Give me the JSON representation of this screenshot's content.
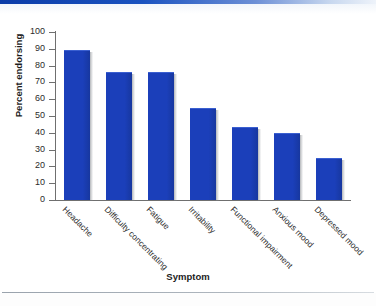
{
  "chart_data": {
    "type": "bar",
    "title": "",
    "xlabel": "Symptom",
    "ylabel": "Percent endorsing",
    "categories": [
      "Headache",
      "Difficulty concentrating",
      "Fatigue",
      "Irritability",
      "Functional impairment",
      "Anxious mood",
      "Depressed mood"
    ],
    "values": [
      89,
      76,
      76,
      55,
      43.5,
      40,
      25
    ],
    "ylim": [
      0,
      100
    ],
    "yticks": [
      0,
      10,
      20,
      30,
      40,
      50,
      60,
      70,
      80,
      90,
      100
    ],
    "ytick_labels": [
      "0",
      "10",
      "20",
      "30",
      "40",
      "50",
      "60",
      "70",
      "80",
      "90",
      "100"
    ],
    "grid": false,
    "legend": null,
    "bar_color": "#1b3fba",
    "axis_color": "#6f6f6f",
    "text_color": "#2b2b2b"
  },
  "decor": {
    "top_rule_color": "#0b3ca8",
    "bottom_rule_color": "#9aa3ad"
  }
}
